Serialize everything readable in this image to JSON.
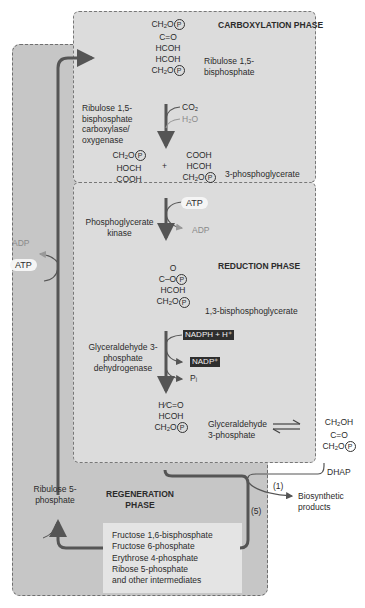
{
  "phases": {
    "carboxylation": "CARBOXYLATION PHASE",
    "reduction": "REDUCTION PHASE",
    "regeneration": "REGENERATION PHASE"
  },
  "molecules": {
    "rubp": {
      "name": "Ribulose 1,5-bisphosphate",
      "lines": [
        "CH₂O(P)",
        "C=O",
        "HCOH",
        "HCOH",
        "CH₂O(P)"
      ]
    },
    "pga": {
      "name": "3-phosphoglycerate",
      "left": [
        "CH₂O(P)",
        "HOCH",
        "COOH"
      ],
      "plus": "+",
      "right": [
        "COOH",
        "HCOH",
        "CH₂O(P)"
      ]
    },
    "bpg": {
      "name": "1,3-bisphosphoglycerate",
      "lines": [
        "O",
        "C–O(P)",
        "HCOH",
        "CH₂O(P)"
      ]
    },
    "g3p": {
      "name": "Glyceraldehyde 3-phosphate",
      "lines": [
        "H",
        "C=O",
        "HCOH",
        "CH₂O(P)"
      ]
    },
    "dhap": {
      "name": "DHAP",
      "lines": [
        "CH₂OH",
        "C=O",
        "CH₂O(P)"
      ]
    },
    "ru5p": {
      "name": "Ribulose 5-phosphate"
    }
  },
  "enzymes": {
    "rubisco": "Ribulose 1,5-bisphosphate carboxylase/ oxygenase",
    "pgk": "Phosphoglycerate kinase",
    "gapdh": "Glyceraldehyde 3-phosphate dehydrogenase"
  },
  "cofactors": {
    "co2": "CO₂",
    "h2o": "H₂O",
    "atp": "ATP",
    "adp": "ADP",
    "nadph": "NADPH + H⁺",
    "nadp": "NADP⁺",
    "pi": "Pᵢ",
    "atp_regen": "ATP",
    "adp_regen": "ADP"
  },
  "branches": {
    "one": "(1)",
    "five": "(5)",
    "biosynthetic": "Biosynthetic products"
  },
  "intermediates": [
    "Fructose 1,6-bisphosphate",
    "Fructose 6-phosphate",
    "Erythrose 4-phosphate",
    "Ribose 5-phosphate",
    "and other intermediates"
  ],
  "colors": {
    "regeneration_bg": "#c6c6c6",
    "phase_bg": "#dcdcdc",
    "arrow": "#555555",
    "dark_tag": "#2e2e2e"
  }
}
